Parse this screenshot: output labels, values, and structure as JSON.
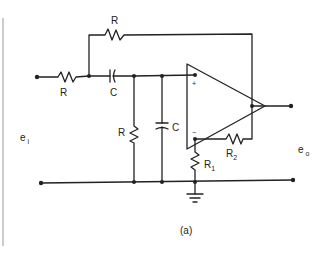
{
  "figure": {
    "caption": "(a)",
    "type": "active filter circuit schematic"
  },
  "labels": {
    "input_resistor": "R",
    "feedback_resistor": "R",
    "series_capacitor": "C",
    "shunt_resistor": "R",
    "shunt_capacitor": "C",
    "r1_main": "R",
    "r1_sub": "1",
    "r2_main": "R",
    "r2_sub": "2",
    "input_voltage_main": "e",
    "input_voltage_sub": "i",
    "output_voltage_main": "e",
    "output_voltage_sub": "o",
    "plus_input": "+",
    "minus_input": "−"
  },
  "components": [
    {
      "id": "input-resistor",
      "kind": "resistor",
      "label": "R"
    },
    {
      "id": "feedback-resistor",
      "kind": "resistor",
      "label": "R"
    },
    {
      "id": "series-capacitor",
      "kind": "capacitor",
      "label": "C"
    },
    {
      "id": "shunt-resistor",
      "kind": "resistor",
      "label": "R"
    },
    {
      "id": "shunt-capacitor",
      "kind": "capacitor",
      "label": "C"
    },
    {
      "id": "op-amp",
      "kind": "operational amplifier"
    },
    {
      "id": "resistor-r1",
      "kind": "resistor",
      "label": "R1"
    },
    {
      "id": "resistor-r2",
      "kind": "resistor",
      "label": "R2"
    },
    {
      "id": "ground",
      "kind": "ground"
    }
  ]
}
